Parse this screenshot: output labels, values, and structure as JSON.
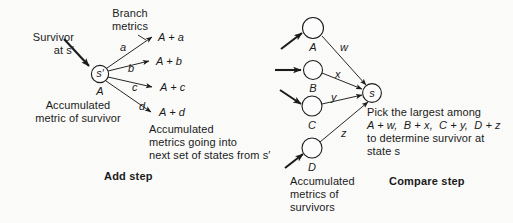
{
  "figure": {
    "title_add": "Add step",
    "title_compare": "Compare step"
  },
  "add_step": {
    "survivor_label_line1": "Survivor",
    "survivor_label_line2": "at s′",
    "branch_metrics_line1": "Branch",
    "branch_metrics_line2": "metrics",
    "state_node": "s′",
    "accumulated_metric_symbol": "A",
    "branch_values": [
      "a",
      "b",
      "c",
      "d"
    ],
    "sum_labels": [
      "A + a",
      "A + b",
      "A + c",
      "A + d"
    ],
    "accum_metric_caption_line1": "Accumulated",
    "accum_metric_caption_line2": "metric of survivor",
    "outgoing_caption_line1": "Accumulated",
    "outgoing_caption_line2": "metrics going into",
    "outgoing_caption_line3": "next set of states from s′"
  },
  "compare_step": {
    "state_nodes": [
      "A",
      "B",
      "C",
      "D"
    ],
    "branch_values": [
      "w",
      "x",
      "y",
      "z"
    ],
    "target_node": "s",
    "explanation_line1": "Pick the largest among",
    "explanation_line2": "A + w,  B + x,  C + y,  D + z",
    "explanation_line3": "to determine survivor at",
    "explanation_line4": "state s",
    "accum_caption_line1": "Accumulated",
    "accum_caption_line2": "metrics of",
    "accum_caption_line3": "survivors"
  },
  "style": {
    "ink": "#1a1a1a",
    "paper": "#fdfdfc"
  }
}
